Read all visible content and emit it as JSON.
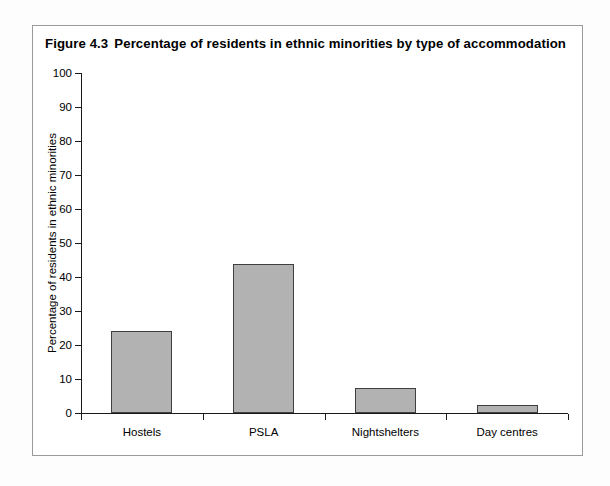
{
  "figure": {
    "number": "Figure 4.3",
    "title": "Percentage of residents in ethnic minorities by type of accommodation",
    "frame_color": "#9a9a9a",
    "background": "#ffffff"
  },
  "chart_data": {
    "type": "bar",
    "categories": [
      "Hostels",
      "PSLA",
      "Nightshelters",
      "Day centres"
    ],
    "values": [
      24,
      43.8,
      7.4,
      2.4
    ],
    "xlabel": "",
    "ylabel": "Percentage of residents in ethnic minorities",
    "ylim": [
      0,
      100
    ],
    "y_ticks": [
      0,
      10,
      20,
      30,
      40,
      50,
      60,
      70,
      80,
      90,
      100
    ],
    "y_tick_labels": [
      "0",
      "10",
      "20",
      "30",
      "40",
      "50",
      "60",
      "70",
      "80",
      "90",
      "100"
    ],
    "grid": false,
    "legend": null,
    "bar_fill_color": "#b2b2b2",
    "bar_edge_color": "#3f3f3f",
    "axis_color": "#1a1a1a"
  }
}
